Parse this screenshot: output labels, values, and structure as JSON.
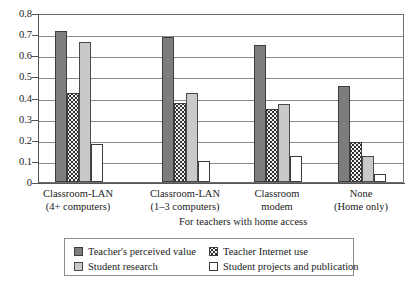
{
  "chart_data": {
    "type": "bar",
    "title": "",
    "xlabel": "For teachers with home access",
    "ylabel": "",
    "ylim": [
      0,
      0.8
    ],
    "ytick_labels": [
      "0.8",
      "0.7",
      "0.6",
      "0.5",
      "0.4",
      "0.3",
      "0.2",
      "0.1",
      "0"
    ],
    "ytick_values": [
      0.8,
      0.7,
      0.6,
      0.5,
      0.4,
      0.3,
      0.2,
      0.1,
      0
    ],
    "grid": true,
    "legend_position": "bottom",
    "categories": [
      "Classroom-LAN\n(4+ computers)",
      "Classroom-LAN\n(1–3 computers)",
      "Classroom\nmodem",
      "None\n(Home only)"
    ],
    "category_lines": [
      [
        "Classroom-LAN",
        "(4+ computers)"
      ],
      [
        "Classroom-LAN",
        "(1–3 computers)"
      ],
      [
        "Classroom",
        "modem"
      ],
      [
        "None",
        "(Home only)"
      ]
    ],
    "series": [
      {
        "name": "Teacher's perceived value",
        "swatch": "dark-gray-solid",
        "color": "#7d7d7d",
        "values": [
          0.715,
          0.685,
          0.65,
          0.455
        ]
      },
      {
        "name": "Teacher Internet use",
        "swatch": "dotted-pattern",
        "color": "#f2f2f2",
        "values": [
          0.42,
          0.375,
          0.345,
          0.19
        ]
      },
      {
        "name": "Student research",
        "swatch": "light-gray-solid",
        "color": "#c9c9c9",
        "values": [
          0.665,
          0.42,
          0.37,
          0.125
        ]
      },
      {
        "name": "Student projects and publication",
        "swatch": "white-outline",
        "color": "#ffffff",
        "values": [
          0.18,
          0.1,
          0.125,
          0.04
        ]
      }
    ]
  },
  "legend": {
    "entries": [
      {
        "label": "Teacher's perceived value"
      },
      {
        "label": "Teacher Internet use"
      },
      {
        "label": "Student research"
      },
      {
        "label": "Student projects and publication"
      }
    ]
  }
}
